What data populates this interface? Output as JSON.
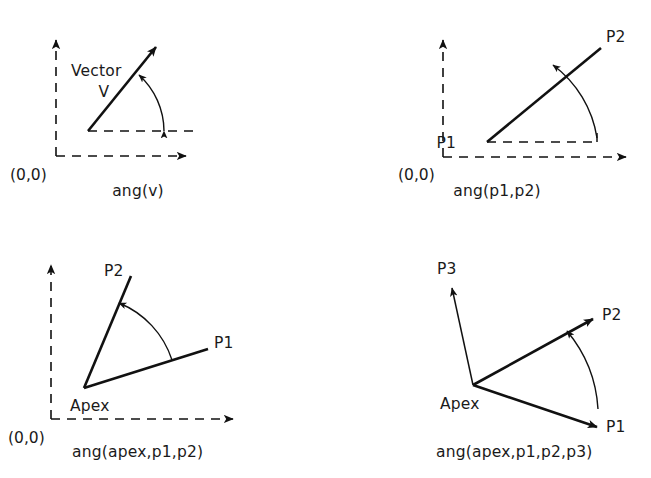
{
  "figure": {
    "background_color": "#ffffff",
    "line_color": "#111111",
    "panel_count": 4
  },
  "panels": [
    {
      "id": "panel-ang-v",
      "caption": "ang(v)",
      "origin_label": "(0,0)",
      "labels": {
        "vector_word": "Vector",
        "vector_symbol": "V"
      },
      "description": "Single vector V from a point, angle measured from horizontal dashed reference to the vector",
      "axes": {
        "style": "dashed",
        "x_arrow": true,
        "y_arrow": true
      },
      "reference_line": {
        "style": "dashed",
        "direction": "horizontal"
      },
      "arc": {
        "direction": "from-horizontal-to-vector",
        "arrowheads": 2
      },
      "rays": [
        {
          "name": "vector-v",
          "style": "solid",
          "arrowhead": true
        }
      ]
    },
    {
      "id": "panel-ang-p1-p2",
      "caption": "ang(p1,p2)",
      "origin_label": "(0,0)",
      "labels": {
        "p1": "P1",
        "p2": "P2"
      },
      "description": "Angle of the line from point P1 to point P2 measured from a horizontal dashed reference at P1",
      "axes": {
        "style": "dashed",
        "x_arrow": true,
        "y_arrow": true
      },
      "reference_line": {
        "style": "dashed",
        "direction": "horizontal"
      },
      "arc": {
        "direction": "from-horizontal-to-line",
        "arrowheads": 1
      },
      "rays": [
        {
          "name": "p1-to-p2",
          "style": "solid",
          "arrowhead": false
        }
      ]
    },
    {
      "id": "panel-ang-apex-p1-p2",
      "caption": "ang(apex,p1,p2)",
      "origin_label": "(0,0)",
      "labels": {
        "apex": "Apex",
        "p1": "P1",
        "p2": "P2"
      },
      "description": "Angle at an apex subtended between ray to P1 and ray to P2",
      "axes": {
        "style": "dashed",
        "x_arrow": true,
        "y_arrow": true
      },
      "reference_line": null,
      "arc": {
        "direction": "from-p1-to-p2",
        "arrowheads": 1
      },
      "rays": [
        {
          "name": "apex-to-p1",
          "style": "solid",
          "arrowhead": false
        },
        {
          "name": "apex-to-p2",
          "style": "solid",
          "arrowhead": false
        }
      ]
    },
    {
      "id": "panel-ang-apex-p1-p2-p3",
      "caption": "ang(apex,p1,p2,p3)",
      "origin_label": null,
      "labels": {
        "apex": "Apex",
        "p1": "P1",
        "p2": "P2",
        "p3": "P3"
      },
      "description": "Angle at an apex between ray to P1 and ray to P2, with a third reference ray to P3 defining orientation",
      "axes": null,
      "reference_line": null,
      "arc": {
        "direction": "from-p1-to-p2",
        "arrowheads": 1
      },
      "rays": [
        {
          "name": "apex-to-p1",
          "style": "solid",
          "arrowhead": true
        },
        {
          "name": "apex-to-p2",
          "style": "solid",
          "arrowhead": true
        },
        {
          "name": "apex-to-p3",
          "style": "thin",
          "arrowhead": true
        }
      ]
    }
  ]
}
